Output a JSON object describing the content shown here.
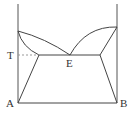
{
  "diagram": {
    "type": "eutectic phase diagram",
    "labels": {
      "T": "T",
      "E": "E",
      "A": "A",
      "B": "B"
    },
    "line_color": "#444444",
    "dashed_color": "#999999"
  }
}
